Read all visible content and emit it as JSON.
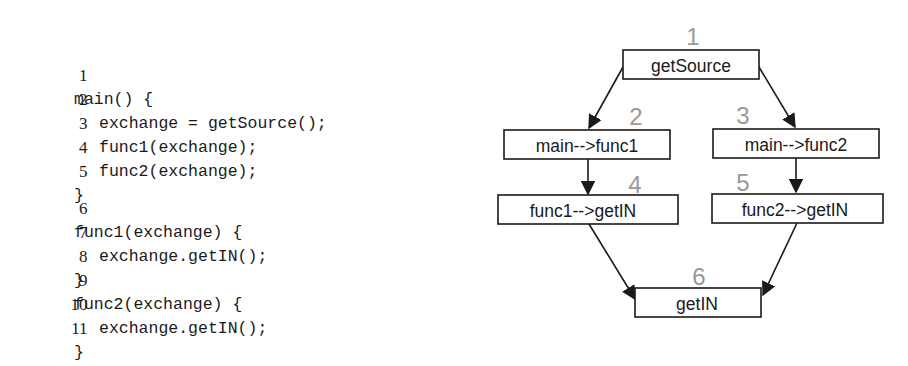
{
  "code_listing": {
    "lines": [
      {
        "number": "1",
        "text": "main() {",
        "indent": 0
      },
      {
        "number": "2",
        "text": "exchange = getSource();",
        "indent": 1
      },
      {
        "number": "3",
        "text": "func1(exchange);",
        "indent": 1
      },
      {
        "number": "4",
        "text": "func2(exchange);",
        "indent": 1
      },
      {
        "number": "5",
        "text": "}",
        "indent": 0
      },
      {
        "number": "6",
        "text": "func1(exchange) {",
        "indent": 0
      },
      {
        "number": "7",
        "text": "exchange.getIN();",
        "indent": 1
      },
      {
        "number": "8",
        "text": "}",
        "indent": 0
      },
      {
        "number": "9",
        "text": "func2(exchange) {",
        "indent": 0
      },
      {
        "number": "10",
        "text": "exchange.getIN();",
        "indent": 1
      },
      {
        "number": "11",
        "text": "}",
        "indent": 0
      }
    ]
  },
  "diagram": {
    "colors": {
      "box_border": "#1a1a1a",
      "text": "#1a1a1a",
      "node_number": "#999999",
      "arrow": "#1a1a1a"
    },
    "nodes": [
      {
        "id": "1",
        "number": "1",
        "label": "getSource"
      },
      {
        "id": "2",
        "number": "2",
        "label": "main-->func1"
      },
      {
        "id": "3",
        "number": "3",
        "label": "main-->func2"
      },
      {
        "id": "4",
        "number": "4",
        "label": "func1-->getIN"
      },
      {
        "id": "5",
        "number": "5",
        "label": "func2-->getIN"
      },
      {
        "id": "6",
        "number": "6",
        "label": "getIN"
      }
    ],
    "edges": [
      {
        "from": "1",
        "to": "2"
      },
      {
        "from": "1",
        "to": "3"
      },
      {
        "from": "2",
        "to": "4"
      },
      {
        "from": "3",
        "to": "5"
      },
      {
        "from": "4",
        "to": "6"
      },
      {
        "from": "5",
        "to": "6"
      }
    ]
  }
}
